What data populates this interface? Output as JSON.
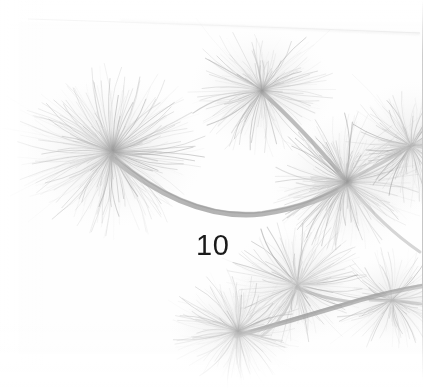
{
  "page": {
    "width": 444,
    "height": 392,
    "background_color": "#ffffff",
    "page_number": "10",
    "page_number_color": "#1a1a1a"
  },
  "photograph": {
    "subject": "pine-branch-needle-clusters",
    "treatment": "very-pale-high-key-grayscale-scan",
    "region": {
      "x": 0,
      "y": 0,
      "width": 423,
      "height": 392
    },
    "background_color": "#fefefe",
    "tones": {
      "lightest_needle": "#ececec",
      "mid_needle": "#d2d2d2",
      "dark_needle": "#b4b4b4",
      "branch": "#a8a8a8",
      "darkest_node": "#8e8e8e"
    },
    "clusters": [
      {
        "name": "left-large-cluster",
        "cx": 112,
        "cy": 152,
        "radius": 78,
        "density": "high"
      },
      {
        "name": "top-center-cluster",
        "cx": 262,
        "cy": 90,
        "radius": 60,
        "density": "medium"
      },
      {
        "name": "right-middle-cluster",
        "cx": 346,
        "cy": 182,
        "radius": 62,
        "density": "high"
      },
      {
        "name": "far-right-cluster",
        "cx": 411,
        "cy": 146,
        "radius": 54,
        "density": "medium"
      },
      {
        "name": "lower-right-cluster",
        "cx": 297,
        "cy": 285,
        "radius": 58,
        "density": "medium"
      },
      {
        "name": "lower-left-cluster",
        "cx": 238,
        "cy": 331,
        "radius": 56,
        "density": "medium"
      },
      {
        "name": "lower-far-right-cluster",
        "cx": 392,
        "cy": 300,
        "radius": 48,
        "density": "low"
      }
    ],
    "branches": [
      {
        "name": "main-sweeping-arc",
        "from": [
          118,
          160
        ],
        "to": [
          352,
          186
        ],
        "sag": 212
      },
      {
        "name": "top-center-to-right-branch",
        "from": [
          262,
          94
        ],
        "to": [
          350,
          180
        ]
      },
      {
        "name": "lower-connecting-branch",
        "from": [
          236,
          334
        ],
        "to": [
          404,
          292
        ]
      },
      {
        "name": "lower-left-to-right-branch",
        "from": [
          240,
          330
        ],
        "to": [
          300,
          288
        ]
      },
      {
        "name": "faint-top-diagonal",
        "from": [
          30,
          20
        ],
        "to": [
          420,
          32
        ]
      }
    ]
  }
}
